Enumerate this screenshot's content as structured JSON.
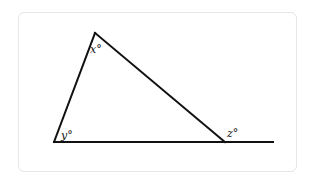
{
  "diagram": {
    "type": "triangle-with-exterior-angle",
    "line_color": "#111111",
    "card_border_color": "#e6e6e6",
    "vertices": {
      "apex": {
        "x": 95,
        "y": 33
      },
      "bottom_left": {
        "x": 54,
        "y": 142
      },
      "bottom_right": {
        "x": 225,
        "y": 142
      }
    },
    "baseline_extension_end": {
      "x": 273,
      "y": 142
    },
    "angle_labels": {
      "apex": "x°",
      "bottom_left": "y°",
      "exterior_right": "z°"
    }
  }
}
